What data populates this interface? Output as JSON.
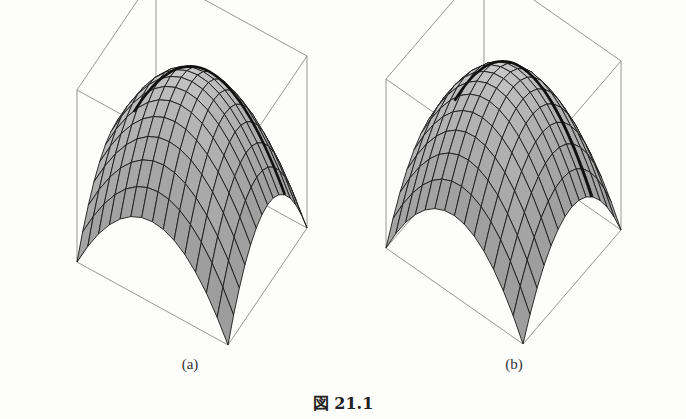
{
  "figure": {
    "caption": "図 21.1",
    "panels": [
      {
        "label": "(a)"
      },
      {
        "label": "(b)"
      }
    ]
  },
  "colors": {
    "background": "#fdfdfb",
    "box_edge": "#8a8a8a",
    "mesh_line": "#1a1a1a",
    "surface_light": "#f2f2f2",
    "surface_dark": "#6a6a6a",
    "highlight_curve": "#111111"
  }
}
